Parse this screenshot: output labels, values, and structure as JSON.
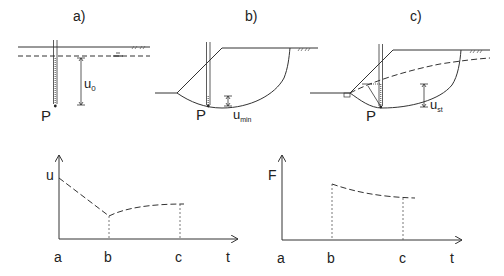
{
  "panels": {
    "a": {
      "label": "a)",
      "point": "P",
      "dimension": "u",
      "dimension_sub": "0"
    },
    "b": {
      "label": "b)",
      "point": "P",
      "dimension": "u",
      "dimension_sub": "min"
    },
    "c": {
      "label": "c)",
      "point": "P",
      "dimension": "u",
      "dimension_sub": "st"
    }
  },
  "graphs": {
    "pore_pressure": {
      "y_label": "u",
      "x_label": "t",
      "ticks": [
        "a",
        "b",
        "c"
      ]
    },
    "factor_of_safety": {
      "y_label": "F",
      "x_label": "t",
      "ticks": [
        "a",
        "b",
        "c"
      ]
    }
  },
  "colors": {
    "line": "#333333",
    "text": "#222222",
    "background": "#ffffff"
  }
}
